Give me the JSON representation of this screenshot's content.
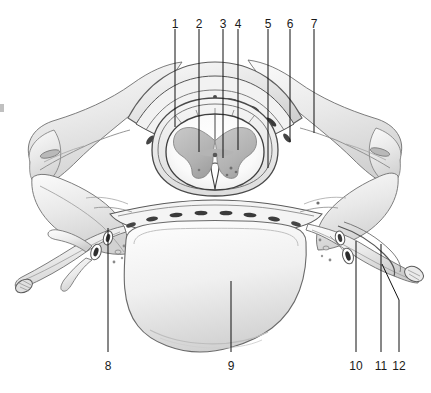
{
  "figure": {
    "background": "#ffffff",
    "ink": "#111111",
    "width": 431,
    "height": 393
  },
  "labels": {
    "top": [
      {
        "id": "1",
        "text": "1",
        "x": 175,
        "tick_y1": 29,
        "tick_y2": 40,
        "lead_y1": 40,
        "lead_y2": 127
      },
      {
        "id": "2",
        "text": "2",
        "x": 199,
        "tick_y1": 29,
        "tick_y2": 40,
        "lead_y1": 40,
        "lead_y2": 152
      },
      {
        "id": "3",
        "text": "3",
        "x": 223,
        "tick_y1": 29,
        "tick_y2": 40,
        "lead_y1": 40,
        "lead_y2": 158
      },
      {
        "id": "4",
        "text": "4",
        "x": 238,
        "tick_y1": 29,
        "tick_y2": 40,
        "lead_y1": 40,
        "lead_y2": 150
      },
      {
        "id": "5",
        "text": "5",
        "x": 268,
        "tick_y1": 29,
        "tick_y2": 40,
        "lead_y1": 40,
        "lead_y2": 168
      },
      {
        "id": "6",
        "text": "6",
        "x": 290,
        "tick_y1": 29,
        "tick_y2": 40,
        "lead_y1": 40,
        "lead_y2": 142
      },
      {
        "id": "7",
        "text": "7",
        "x": 314,
        "tick_y1": 29,
        "tick_y2": 40,
        "lead_y1": 40,
        "lead_y2": 133
      }
    ],
    "bottom": [
      {
        "id": "8",
        "text": "8",
        "x": 108,
        "lead_y1": 228,
        "lead_y2": 352
      },
      {
        "id": "9",
        "text": "9",
        "x": 231,
        "lead_y1": 281,
        "lead_y2": 352
      },
      {
        "id": "10",
        "text": "10",
        "x": 356,
        "lead_y1": 241,
        "lead_y2": 352
      },
      {
        "id": "11",
        "text": "11",
        "x": 381,
        "lead_y1": 244,
        "lead_y2": 352
      },
      {
        "id": "12",
        "text": "12",
        "x": 399,
        "lead_y1": 264,
        "lead_y2": 352,
        "angled": true,
        "tip_x": 382,
        "tip_y": 264,
        "bend_x": 399,
        "bend_y": 300
      }
    ],
    "top_text_y": 18,
    "bottom_text_y": 360
  }
}
